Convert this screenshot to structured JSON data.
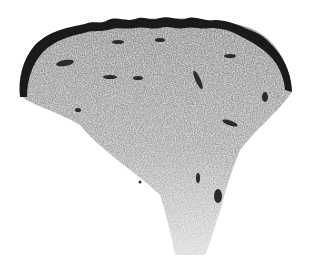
{
  "image": {
    "subject": "grayscale histology section of skin tissue",
    "background_color": "#ffffff",
    "epidermis_color": "#1a1a1a",
    "dermis_color": "#9a9a9a",
    "stalk_color": "#c4c4c4",
    "vessel_color": "#2a2a2a"
  }
}
